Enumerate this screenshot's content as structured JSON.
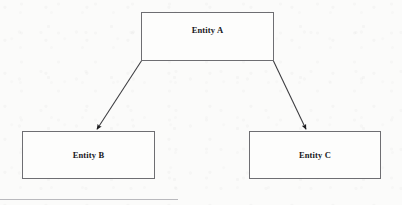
{
  "diagram": {
    "type": "entity-relationship-hierarchy",
    "background_color": "#fbfbfa",
    "stroke_color": "#6e6e72",
    "text_color": "#17171a",
    "nodes": [
      {
        "id": "entity-a",
        "label": "Entity A",
        "role": "parent",
        "x": 141,
        "y": 12,
        "width": 133,
        "height": 49
      },
      {
        "id": "entity-b",
        "label": "Entity B",
        "role": "child",
        "x": 22,
        "y": 131,
        "width": 133,
        "height": 48
      },
      {
        "id": "entity-c",
        "label": "Entity C",
        "role": "child",
        "x": 249,
        "y": 131,
        "width": 132,
        "height": 48
      }
    ],
    "edges": [
      {
        "id": "edge-a-to-b",
        "from": "entity-a",
        "to": "entity-b",
        "label": "",
        "arrowhead": "filled-triangle",
        "from_x": 142,
        "from_y": 60,
        "to_x": 96,
        "to_y": 130
      },
      {
        "id": "edge-a-to-c",
        "from": "entity-a",
        "to": "entity-c",
        "label": "",
        "arrowhead": "filled-triangle",
        "from_x": 273,
        "from_y": 60,
        "to_x": 307,
        "to_y": 130
      }
    ],
    "page_rule": {
      "visible": true,
      "color": "#b9b9bd"
    }
  }
}
